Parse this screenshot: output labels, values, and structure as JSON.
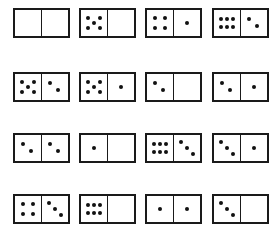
{
  "colors": {
    "ink": "#1a1a1a",
    "background": "#ffffff"
  },
  "dominoes": [
    {
      "row": 0,
      "col": 0,
      "left": 0,
      "right": 0
    },
    {
      "row": 0,
      "col": 1,
      "left": 5,
      "right": 0
    },
    {
      "row": 0,
      "col": 2,
      "left": 4,
      "right": 1
    },
    {
      "row": 0,
      "col": 3,
      "left": 6,
      "right": 2
    },
    {
      "row": 1,
      "col": 0,
      "left": 5,
      "right": 2
    },
    {
      "row": 1,
      "col": 1,
      "left": 5,
      "right": 1
    },
    {
      "row": 1,
      "col": 2,
      "left": 2,
      "right": 0
    },
    {
      "row": 1,
      "col": 3,
      "left": 2,
      "right": 1
    },
    {
      "row": 2,
      "col": 0,
      "left": 2,
      "right": 2
    },
    {
      "row": 2,
      "col": 1,
      "left": 1,
      "right": 0
    },
    {
      "row": 2,
      "col": 2,
      "left": 6,
      "right": 3
    },
    {
      "row": 2,
      "col": 3,
      "left": 3,
      "right": 1
    },
    {
      "row": 3,
      "col": 0,
      "left": 4,
      "right": 3
    },
    {
      "row": 3,
      "col": 1,
      "left": 6,
      "right": 0
    },
    {
      "row": 3,
      "col": 2,
      "left": 1,
      "right": 1
    },
    {
      "row": 3,
      "col": 3,
      "left": 3,
      "right": 0
    }
  ]
}
